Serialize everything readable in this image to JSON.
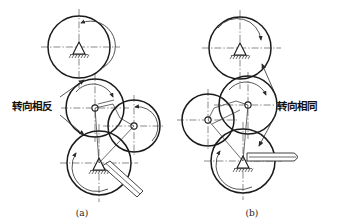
{
  "figure": {
    "background_color": "#ffffff",
    "line_color": "#1a1a1a",
    "type": "mechanical-engineering-line-drawing"
  },
  "panels": [
    {
      "id": "a",
      "caption": "(a)",
      "annotation": "转向相反",
      "annotation_meaning_label": "opposite-rotation-direction",
      "annotation_position": {
        "x": 12,
        "y": 106
      },
      "leaders": [
        {
          "name": "leader-upper",
          "from": {
            "x": 62,
            "y": 96
          },
          "to": {
            "x": 84,
            "y": 80
          }
        },
        {
          "name": "leader-lower",
          "from": {
            "x": 62,
            "y": 114
          },
          "to": {
            "x": 84,
            "y": 134
          }
        }
      ],
      "wheels": [
        {
          "name": "top-wheel",
          "cx": 79,
          "cy": 47,
          "r": 31,
          "center_symbol": "fixed-support",
          "rotation_arrow": "counterclockwise",
          "arrow_label": "rotation-arrow-ccw"
        },
        {
          "name": "middle-wheel",
          "cx": 95,
          "cy": 108,
          "r": 29,
          "center_symbol": "pivot-joint",
          "rotation_arrow": "clockwise",
          "arrow_label": "rotation-arrow-cw"
        },
        {
          "name": "right-wheel",
          "cx": 134,
          "cy": 126,
          "r": 26,
          "center_symbol": "pivot-joint",
          "rotation_arrow": "counterclockwise",
          "arrow_label": "rotation-arrow-ccw"
        },
        {
          "name": "bottom-wheel",
          "cx": 99,
          "cy": 163,
          "r": 32,
          "center_symbol": "fixed-support",
          "rotation_arrow": "counterclockwise",
          "arrow_label": "rotation-arrow-ccw",
          "handle": "lever-down-right"
        }
      ],
      "links": [
        {
          "name": "link-middle-to-bottom",
          "from": {
            "x": 95,
            "y": 108
          },
          "to": {
            "x": 99,
            "y": 163
          }
        },
        {
          "name": "link-right-to-bottom",
          "from": {
            "x": 134,
            "y": 126
          },
          "to": {
            "x": 99,
            "y": 163
          }
        },
        {
          "name": "link-middle-to-right",
          "from": {
            "x": 95,
            "y": 108
          },
          "to": {
            "x": 134,
            "y": 126
          }
        }
      ]
    },
    {
      "id": "b",
      "caption": "(b)",
      "annotation": "转向相同",
      "annotation_meaning_label": "same-rotation-direction",
      "annotation_position": {
        "x": 277,
        "y": 106
      },
      "leaders": [
        {
          "name": "leader-upper",
          "from": {
            "x": 274,
            "y": 96
          },
          "to": {
            "x": 261,
            "y": 64
          }
        },
        {
          "name": "leader-lower",
          "from": {
            "x": 274,
            "y": 114
          },
          "to": {
            "x": 258,
            "y": 146
          }
        }
      ],
      "wheels": [
        {
          "name": "top-wheel",
          "cx": 240,
          "cy": 48,
          "r": 31,
          "center_symbol": "fixed-support",
          "rotation_arrow": "clockwise",
          "arrow_label": "rotation-arrow-cw"
        },
        {
          "name": "middle-wheel",
          "cx": 248,
          "cy": 105,
          "r": 29,
          "center_symbol": "pivot-joint",
          "rotation_arrow": "clockwise",
          "arrow_label": "rotation-arrow-cw"
        },
        {
          "name": "left-wheel",
          "cx": 208,
          "cy": 120,
          "r": 26,
          "center_symbol": "pivot-joint",
          "rotation_arrow": "none",
          "arrow_label": "no-arrow"
        },
        {
          "name": "bottom-wheel",
          "cx": 243,
          "cy": 161,
          "r": 32,
          "center_symbol": "fixed-support",
          "rotation_arrow": "counterclockwise",
          "arrow_label": "rotation-arrow-ccw",
          "handle": "lever-horizontal-right"
        }
      ],
      "links": [
        {
          "name": "link-middle-to-bottom",
          "from": {
            "x": 248,
            "y": 105
          },
          "to": {
            "x": 243,
            "y": 161
          }
        },
        {
          "name": "link-left-to-bottom",
          "from": {
            "x": 208,
            "y": 120
          },
          "to": {
            "x": 243,
            "y": 161
          }
        },
        {
          "name": "link-left-to-middle",
          "from": {
            "x": 208,
            "y": 120
          },
          "to": {
            "x": 248,
            "y": 105
          }
        }
      ]
    }
  ],
  "symbols": {
    "fixed_support": "pin-support-with-hatching",
    "pivot_joint": "open-circle-revolute-joint",
    "centerline_style": "dash-dot"
  }
}
